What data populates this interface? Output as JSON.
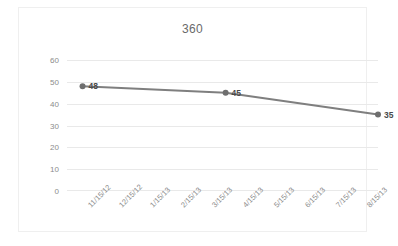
{
  "chart_data": {
    "type": "line",
    "title": "360",
    "xlabel": "",
    "ylabel": "",
    "categories": [
      "11/15/12",
      "12/15/12",
      "1/15/13",
      "2/15/13",
      "3/15/13",
      "4/15/13",
      "5/15/13",
      "6/15/13",
      "7/15/13",
      "8/15/13"
    ],
    "yticks": [
      0,
      10,
      20,
      30,
      40,
      50,
      60
    ],
    "ylim": [
      0,
      60
    ],
    "grid": true,
    "legend": "none",
    "series": [
      {
        "name": "360",
        "points": [
          {
            "x": "11/15/12",
            "x_index": 0,
            "y": 48,
            "label": "48"
          },
          {
            "x": "4/15/13",
            "x_index": 4.6,
            "y": 45,
            "label": "45"
          },
          {
            "x": "8/15/13",
            "x_index": 9.5,
            "y": 35,
            "label": "35"
          }
        ],
        "color": "#7f7f7f",
        "marker": "circle"
      }
    ]
  },
  "axis": {
    "y_labels": [
      "60",
      "50",
      "40",
      "30",
      "20",
      "10",
      "0"
    ],
    "x_labels": [
      "11/15/12",
      "12/15/12",
      "1/15/13",
      "2/15/13",
      "3/15/13",
      "4/15/13",
      "5/15/13",
      "6/15/13",
      "7/15/13",
      "8/15/13"
    ]
  },
  "data_labels": [
    "48",
    "45",
    "35"
  ],
  "colors": {
    "series_line": "#7f7f7f",
    "gridline": "#e9e9e9",
    "tick_text": "#8c8c8c",
    "title_text": "#6a6a6a",
    "label_text": "#4a4a4a",
    "frame_border": "#efefef",
    "background": "#ffffff"
  }
}
